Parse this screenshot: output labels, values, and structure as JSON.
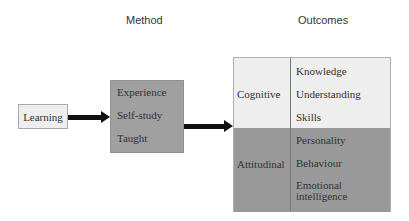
{
  "headers": {
    "method": "Method",
    "outcomes": "Outcomes"
  },
  "input": {
    "label": "Learning"
  },
  "method": {
    "items": [
      "Experience",
      "Self-study",
      "Taught"
    ]
  },
  "outcomes": {
    "cognitive": {
      "label": "Cognitive",
      "items": [
        "Knowledge",
        "Understanding",
        "Skills"
      ]
    },
    "attitudinal": {
      "label": "Attitudinal",
      "items": [
        "Personality",
        "Behaviour",
        "Emotional intelligence"
      ]
    }
  },
  "colors": {
    "light_fill": "#eeeeee",
    "method_fill": "#a0a0a0",
    "dark_fill": "#999999",
    "arrow": "#111111"
  }
}
